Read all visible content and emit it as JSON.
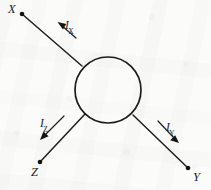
{
  "figure": {
    "type": "circuit-node-diagram",
    "background_color": "#fbfbfa",
    "ink_color": "#1c1c1c"
  },
  "node": {
    "shape": "circle",
    "center_x": 108,
    "center_y": 90,
    "radius": 33,
    "stroke_width": 1.6,
    "name": "central-node"
  },
  "terminals": [
    {
      "id": "X",
      "label": "X",
      "dot_x": 22,
      "dot_y": 14,
      "label_x": 8,
      "label_y": 3,
      "position": "upper-left"
    },
    {
      "id": "Z",
      "label": "Z",
      "dot_x": 40,
      "dot_y": 162,
      "label_x": 31,
      "label_y": 166,
      "position": "lower-left"
    },
    {
      "id": "Y",
      "label": "Y",
      "dot_x": 188,
      "dot_y": 168,
      "label_x": 193,
      "label_y": 171,
      "position": "lower-right"
    }
  ],
  "branches": [
    {
      "id": "branch-X",
      "from_x": 22,
      "from_y": 14,
      "to_x": 82,
      "to_y": 66,
      "terminal": "X"
    },
    {
      "id": "branch-Z",
      "from_x": 40,
      "from_y": 162,
      "to_x": 85,
      "to_y": 114,
      "terminal": "Z"
    },
    {
      "id": "branch-Y",
      "from_x": 188,
      "from_y": 168,
      "to_x": 133,
      "to_y": 115,
      "terminal": "Y"
    }
  ],
  "currents": [
    {
      "id": "IX",
      "symbol": "I",
      "subscript": "X",
      "label_x": 65,
      "label_y": 20,
      "arrow_from_x": 76,
      "arrow_from_y": 38,
      "arrow_to_x": 59,
      "arrow_to_y": 23,
      "direction": "up-left (out of node toward X)"
    },
    {
      "id": "IZ",
      "symbol": "I",
      "subscript": "Z",
      "label_x": 40,
      "label_y": 118,
      "arrow_from_x": 65,
      "arrow_from_y": 117,
      "arrow_to_x": 40,
      "arrow_to_y": 140,
      "direction": "down-left (out of node toward Z)"
    },
    {
      "id": "IY",
      "symbol": "I",
      "subscript": "Y",
      "label_x": 166,
      "label_y": 122,
      "arrow_from_x": 157,
      "arrow_from_y": 120,
      "arrow_to_x": 179,
      "arrow_to_y": 143,
      "direction": "down-right (out of node toward Y)"
    }
  ]
}
